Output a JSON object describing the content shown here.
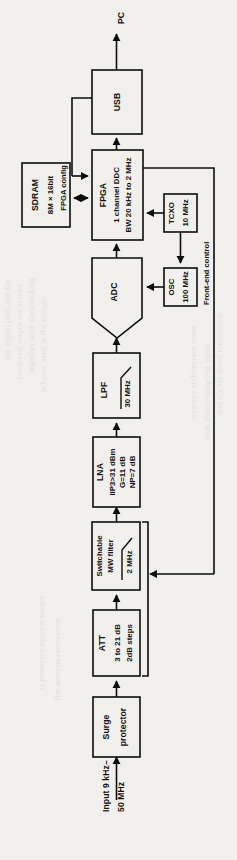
{
  "figure": {
    "orientation": "rotated-90-ccw",
    "background_color": "#f2f0ed",
    "line_color": "#0d0d0d"
  },
  "blocks": {
    "usb": {
      "name": "USB",
      "line1": "USB"
    },
    "fpga": {
      "name": "FPGA",
      "line1": "FPGA",
      "line2": "1 channel DDC",
      "line3": "BW 20 kHz to 2 MHz"
    },
    "sdram": {
      "name": "SDRAM",
      "line1": "SDRAM",
      "line2": "8M × 16bit"
    },
    "adc": {
      "name": "ADC",
      "line1": "ADC"
    },
    "tcxo": {
      "name": "TCXO",
      "line1": "TCXO",
      "line2": "10 MHz"
    },
    "osc": {
      "name": "OSC",
      "line1": "OSC",
      "line2": "100 MHz"
    },
    "lpf": {
      "name": "LPF",
      "line1": "LPF",
      "line2": "30 MHz"
    },
    "lna": {
      "name": "LNA",
      "line1": "LNA",
      "line2": "IIP3>31 dBm",
      "line3": "G=11 dB",
      "line4": "NP=7 dB"
    },
    "mw_filter": {
      "name": "Switchable MW filter",
      "line1": "Switchable",
      "line2": "MW filter",
      "line3": "2 MHz"
    },
    "att": {
      "name": "ATT",
      "line1": "ATT",
      "line2": "3 to 21 dB",
      "line3": "2dB steps"
    },
    "surge": {
      "name": "Surge protector",
      "line1": "Surge",
      "line2": "protector"
    }
  },
  "annotations": {
    "pc": "PC",
    "fpga_config": "FPGA config",
    "front_end_control": "Front-end control",
    "input_line1": "Input 9 kHz–",
    "input_line2": "50 MHz"
  },
  "signal_path": [
    "Input 9 kHz–50 MHz",
    "Surge protector",
    "ATT",
    "Switchable MW filter",
    "LNA",
    "LPF",
    "ADC",
    "FPGA",
    "USB",
    "PC"
  ]
}
